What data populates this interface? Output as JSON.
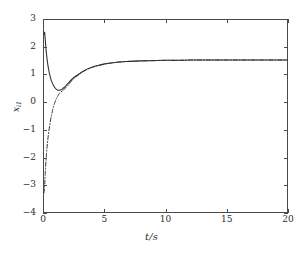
{
  "chart_data": {
    "type": "line",
    "title": "",
    "xlabel": "t/s",
    "ylabel": "x",
    "ylabel_sub": "i1",
    "xlim": [
      0,
      20
    ],
    "ylim": [
      -4,
      3
    ],
    "xticks": [
      0,
      5,
      10,
      15,
      20
    ],
    "xtick_labels": [
      "0",
      "5",
      "10",
      "15",
      "20"
    ],
    "yticks": [
      -4,
      -3,
      -2,
      -1,
      0,
      1,
      2,
      3
    ],
    "ytick_labels": [
      "−4",
      "−3",
      "−2",
      "−1",
      "0",
      "1",
      "2",
      "3"
    ],
    "grid": false,
    "legend": "none",
    "series": [
      {
        "name": "solid-response",
        "style": "solid",
        "color": "#303030",
        "x": [
          0.0,
          0.05,
          0.1,
          0.15,
          0.2,
          0.3,
          0.4,
          0.5,
          0.6,
          0.7,
          0.8,
          0.9,
          1.0,
          1.1,
          1.2,
          1.3,
          1.4,
          1.5,
          1.6,
          1.8,
          2.0,
          2.3,
          2.6,
          3.0,
          3.5,
          4.0,
          4.5,
          5.0,
          5.5,
          6.0,
          6.5,
          7.0,
          7.5,
          8.0,
          9.0,
          10.0,
          11.0,
          12.0,
          13.0,
          14.0,
          16.0,
          18.0,
          20.0
        ],
        "y": [
          2.48,
          2.55,
          2.3,
          2.0,
          1.78,
          1.42,
          1.15,
          0.95,
          0.8,
          0.69,
          0.6,
          0.53,
          0.48,
          0.45,
          0.44,
          0.44,
          0.455,
          0.48,
          0.52,
          0.6,
          0.7,
          0.84,
          0.95,
          1.07,
          1.2,
          1.29,
          1.35,
          1.4,
          1.43,
          1.46,
          1.48,
          1.49,
          1.5,
          1.51,
          1.52,
          1.53,
          1.53,
          1.54,
          1.54,
          1.54,
          1.54,
          1.54,
          1.54
        ]
      },
      {
        "name": "dashdot-response",
        "style": "dashdot",
        "color": "#303030",
        "x": [
          0.0,
          0.05,
          0.1,
          0.2,
          0.3,
          0.4,
          0.5,
          0.6,
          0.7,
          0.8,
          0.9,
          1.0,
          1.1,
          1.2,
          1.3,
          1.4,
          1.5,
          1.6,
          1.8,
          2.0,
          2.3,
          2.6,
          3.0,
          3.5,
          4.0,
          4.5,
          5.0,
          5.5,
          6.0,
          6.5,
          7.0,
          7.5,
          8.0,
          9.0,
          10.0,
          11.0,
          12.0,
          13.0,
          14.0,
          16.0,
          18.0,
          20.0
        ],
        "y": [
          -3.3,
          -3.05,
          -2.6,
          -1.9,
          -1.42,
          -1.05,
          -0.75,
          -0.5,
          -0.3,
          -0.13,
          0.0,
          0.12,
          0.2,
          0.28,
          0.34,
          0.38,
          0.41,
          0.45,
          0.53,
          0.63,
          0.8,
          0.92,
          1.05,
          1.19,
          1.28,
          1.34,
          1.39,
          1.43,
          1.46,
          1.48,
          1.49,
          1.5,
          1.51,
          1.52,
          1.53,
          1.53,
          1.54,
          1.54,
          1.54,
          1.54,
          1.54,
          1.54
        ]
      }
    ],
    "annotations": []
  }
}
